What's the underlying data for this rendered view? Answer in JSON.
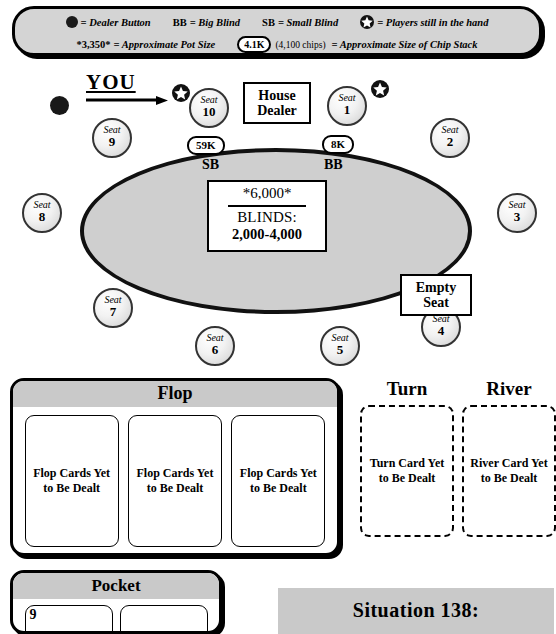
{
  "legend": {
    "row1": [
      {
        "icon": "dealer-button-icon",
        "text": "= Dealer Button"
      },
      {
        "icon": "bb-text",
        "prefix": "BB",
        "text": "= Big Blind"
      },
      {
        "icon": "sb-text",
        "prefix": "SB",
        "text": "= Small Blind"
      },
      {
        "icon": "star-icon",
        "text": "= Players still in the hand"
      }
    ],
    "row2": {
      "pot_example": "*3,350*",
      "pot_text": "= Approximate Pot Size",
      "chip_example": "4.1K",
      "chip_paren": "(4,100 chips)",
      "chip_text": "= Approximate Size of Chip Stack"
    }
  },
  "table": {
    "you_label": "YOU",
    "house_dealer": "House Dealer",
    "empty_seat": "Empty Seat",
    "pot": "*6,000*",
    "blinds_label": "BLINDS:",
    "blinds_value": "2,000-4,000",
    "seat_word": "Seat",
    "seats": [
      {
        "num": "1",
        "active": true
      },
      {
        "num": "2",
        "active": false
      },
      {
        "num": "3",
        "active": false
      },
      {
        "num": "4",
        "active": false
      },
      {
        "num": "5",
        "active": false
      },
      {
        "num": "6",
        "active": false
      },
      {
        "num": "7",
        "active": false
      },
      {
        "num": "8",
        "active": false
      },
      {
        "num": "9",
        "active": false
      },
      {
        "num": "10",
        "active": true
      }
    ],
    "stacks": [
      {
        "seat": "10",
        "amount": "59K",
        "blind": "SB"
      },
      {
        "seat": "1",
        "amount": "8K",
        "blind": "BB"
      }
    ]
  },
  "board": {
    "flop_title": "Flop",
    "turn_title": "Turn",
    "river_title": "River",
    "flop_cards": [
      "Flop Cards Yet to Be Dealt",
      "Flop Cards Yet to Be Dealt",
      "Flop Cards Yet to Be Dealt"
    ],
    "turn_card": "Turn Card Yet to Be Dealt",
    "river_card": "River Card Yet to Be Dealt"
  },
  "pocket": {
    "title": "Pocket",
    "cards": [
      "9",
      ""
    ]
  },
  "situation": {
    "title": "Situation 138:"
  },
  "colors": {
    "felt": "#cfcfcf",
    "panel_header": "#c9c9c9",
    "legend_bg": "#d4d4d4",
    "ink": "#000000"
  }
}
